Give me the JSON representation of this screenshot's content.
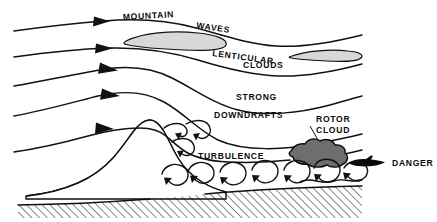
{
  "diagram": {
    "type": "meteorological-cross-section",
    "background_color": "#ffffff",
    "ink_color": "#111111",
    "labels": {
      "mountain": "MOUNTAIN",
      "waves": "WAVES",
      "lenticular": "LENTICULAR",
      "clouds": "CLOUDS",
      "strong": "STRONG",
      "downdrafts": "DOWNDRAFTS",
      "turbulence": "TURBULENCE",
      "rotor": "ROTOR",
      "rotor_cloud": "CLOUD",
      "danger": "DANGER"
    },
    "colors": {
      "lenticular_cloud_fill": "#d8d8d8",
      "rotor_cloud_fill": "#6e6e6e",
      "terrain_hatch": "#111111",
      "aircraft": "#0a0a0a"
    },
    "elements": {
      "streamline_count": 5,
      "lenticular_cloud_count": 2,
      "rotor_cloud_count": 1,
      "aircraft_count": 1,
      "eddy_count": 11
    }
  }
}
